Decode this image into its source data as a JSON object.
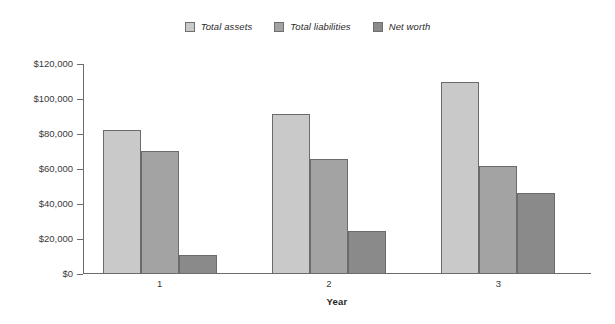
{
  "chart_data": {
    "type": "bar",
    "title": "",
    "xlabel": "Year",
    "ylabel": "",
    "categories": [
      "1",
      "2",
      "3"
    ],
    "series": [
      {
        "name": "Total assets",
        "color": "#c9c9c9",
        "values": [
          82500,
          91500,
          110000
        ]
      },
      {
        "name": "Total liabilities",
        "color": "#a3a3a3",
        "values": [
          70500,
          66000,
          62000
        ]
      },
      {
        "name": "Net worth",
        "color": "#8a8a8a",
        "values": [
          11000,
          24500,
          46500
        ]
      }
    ],
    "ylim": [
      0,
      120000
    ],
    "ytick_step": 20000,
    "ytick_labels": [
      "$0",
      "$20,000",
      "$40,000",
      "$60,000",
      "$80,000",
      "$100,000",
      "$120,000"
    ],
    "ytick_values": [
      0,
      20000,
      40000,
      60000,
      80000,
      100000,
      120000
    ],
    "grid": false,
    "legend_position": "top-center",
    "background": "#ffffff",
    "axis_color": "#6b6b6b"
  },
  "legend": {
    "items": [
      {
        "label": "Total assets"
      },
      {
        "label": "Total liabilities"
      },
      {
        "label": "Net worth"
      }
    ]
  },
  "axes": {
    "x_title": "Year"
  }
}
